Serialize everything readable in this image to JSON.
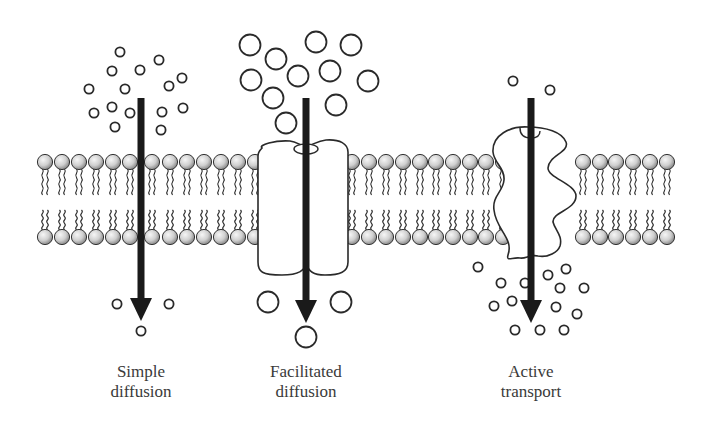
{
  "diagram": {
    "colors": {
      "background": "#ffffff",
      "line": "#2a2a2a",
      "arrow": "#1a1a1a",
      "head_light": "#f4f4f4",
      "head_dark": "#8a8a8a",
      "label": "#3a3a3a"
    },
    "panels": [
      {
        "id": "simple-diffusion",
        "label_line1": "Simple",
        "label_line2": "diffusion",
        "arrow_x": 141,
        "protein": "none",
        "molecules_size": "small",
        "molecules_above": 14,
        "molecules_below": 3
      },
      {
        "id": "facilitated-diffusion",
        "label_line1": "Facilitated",
        "label_line2": "diffusion",
        "arrow_x": 306,
        "protein": "channel",
        "molecules_size": "large",
        "molecules_above": 11,
        "molecules_below": 3
      },
      {
        "id": "active-transport",
        "label_line1": "Active",
        "label_line2": "transport",
        "arrow_x": 531,
        "protein": "carrier-pump",
        "molecules_size": "small",
        "molecules_above": 2,
        "molecules_below": 16
      }
    ],
    "membrane": {
      "type": "phospholipid bilayer",
      "top_head_y": 162,
      "bottom_head_y": 237
    }
  }
}
